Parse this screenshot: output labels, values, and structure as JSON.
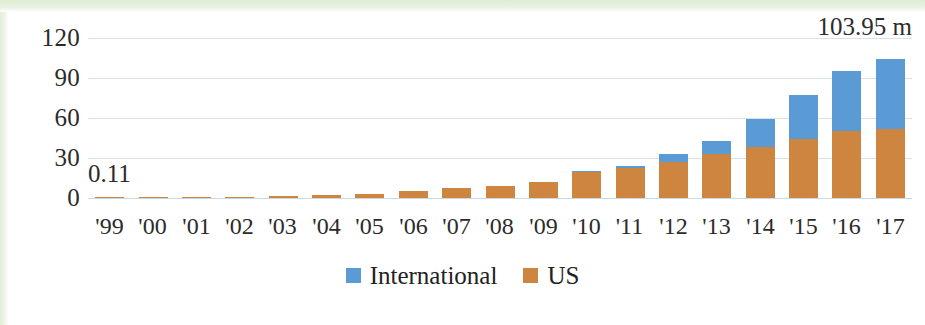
{
  "chart_data": {
    "type": "bar",
    "subtype": "stacked-column",
    "title": "",
    "subtitle": "",
    "xlabel": "",
    "ylabel": "",
    "categories": [
      "'99",
      "'00",
      "'01",
      "'02",
      "'03",
      "'04",
      "'05",
      "'06",
      "'07",
      "'08",
      "'09",
      "'10",
      "'11",
      "'12",
      "'13",
      "'14",
      "'15",
      "'16",
      "'17"
    ],
    "series": [
      {
        "name": "US",
        "color": "#cd853f",
        "values": [
          0.11,
          0.2,
          0.4,
          0.9,
          1.3,
          2.2,
          3.3,
          5.0,
          7.3,
          8.8,
          11.7,
          20.0,
          22.5,
          27.0,
          33.0,
          38.0,
          44.5,
          50.0,
          51.5
        ]
      },
      {
        "name": "International",
        "color": "#5b9bd5",
        "values": [
          0.0,
          0.0,
          0.0,
          0.0,
          0.0,
          0.0,
          0.0,
          0.0,
          0.0,
          0.0,
          0.0,
          0.3,
          1.2,
          5.8,
          10.0,
          21.5,
          32.8,
          45.0,
          52.45
        ]
      }
    ],
    "totals": [
      0.11,
      0.2,
      0.4,
      0.9,
      1.3,
      2.2,
      3.3,
      5.0,
      7.3,
      8.8,
      11.7,
      20.3,
      23.7,
      32.8,
      43.0,
      59.5,
      77.3,
      95.0,
      103.95
    ],
    "ylim": [
      0,
      120
    ],
    "yticks": [
      0,
      30,
      60,
      90,
      120
    ],
    "ytick_labels": [
      "0",
      "30",
      "60",
      "90",
      "120"
    ],
    "grid": true,
    "grid_color": "#d7e3ea",
    "legend_position": "bottom-center",
    "annotations": [
      {
        "id": "first-value",
        "text": "0.11",
        "target_category": "'99",
        "position": "above-left"
      },
      {
        "id": "last-value",
        "text": "103.95 m",
        "target_category": "'17",
        "position": "top-right"
      }
    ]
  },
  "legend": {
    "entries": [
      {
        "label": "International",
        "color": "#5b9bd5",
        "swatch": "square-swatch"
      },
      {
        "label": "US",
        "color": "#cd853f",
        "swatch": "square-swatch"
      }
    ]
  },
  "colors": {
    "international": "#5b9bd5",
    "us": "#cd853f",
    "gridline": "#d7e3ea",
    "text": "#2b2b2b",
    "background": "#ffffff",
    "scan_edge": "#e2eed8"
  }
}
